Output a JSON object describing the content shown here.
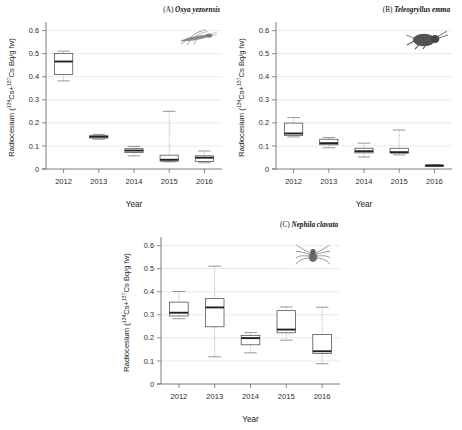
{
  "figure": {
    "axis_titles": {
      "x": "Year",
      "y_main": "Radiocesium (",
      "y_nuc1": "134",
      "y_cs1": "Cs+",
      "y_nuc2": "137",
      "y_cs2": "Cs Bq/g fw)"
    },
    "y_ticks": [
      "0",
      "0.1",
      "0.2",
      "0.3",
      "0.4",
      "0.5",
      "0.6"
    ],
    "x_ticks": [
      "2012",
      "2013",
      "2014",
      "2015",
      "2016"
    ]
  },
  "chart_data": [
    {
      "type": "box",
      "panel": "A",
      "title": "(A) Oxya yezoensis",
      "title_prefix": "(A) ",
      "species": "Oxya yezoensis",
      "icon": "grasshopper-icon",
      "xlabel": "Year",
      "ylabel": "Radiocesium (134Cs+137Cs Bq/g fw)",
      "categories": [
        "2012",
        "2013",
        "2014",
        "2015",
        "2016"
      ],
      "ylim": [
        0,
        0.62
      ],
      "grid": true,
      "boxes": [
        {
          "year": "2012",
          "whisker_low": 0.382,
          "q1": 0.41,
          "median": 0.466,
          "q3": 0.501,
          "whisker_high": 0.511
        },
        {
          "year": "2013",
          "whisker_low": 0.129,
          "q1": 0.134,
          "median": 0.14,
          "q3": 0.144,
          "whisker_high": 0.15
        },
        {
          "year": "2014",
          "whisker_low": 0.057,
          "q1": 0.072,
          "median": 0.08,
          "q3": 0.088,
          "whisker_high": 0.098
        },
        {
          "year": "2015",
          "whisker_low": 0.031,
          "q1": 0.034,
          "median": 0.04,
          "q3": 0.06,
          "whisker_high": 0.25
        },
        {
          "year": "2016",
          "whisker_low": 0.027,
          "q1": 0.033,
          "median": 0.049,
          "q3": 0.057,
          "whisker_high": 0.078
        }
      ]
    },
    {
      "type": "box",
      "panel": "B",
      "title": "(B) Teleogryllus emma",
      "title_prefix": "(B) ",
      "species": "Teleogryllus emma",
      "icon": "cricket-icon",
      "xlabel": "Year",
      "ylabel": "Radiocesium (134Cs+137Cs Bq/g fw)",
      "categories": [
        "2012",
        "2013",
        "2014",
        "2015",
        "2016"
      ],
      "ylim": [
        0,
        0.62
      ],
      "grid": true,
      "boxes": [
        {
          "year": "2012",
          "whisker_low": 0.139,
          "q1": 0.146,
          "median": 0.154,
          "q3": 0.199,
          "whisker_high": 0.223
        },
        {
          "year": "2013",
          "whisker_low": 0.092,
          "q1": 0.105,
          "median": 0.112,
          "q3": 0.129,
          "whisker_high": 0.136
        },
        {
          "year": "2014",
          "whisker_low": 0.052,
          "q1": 0.07,
          "median": 0.077,
          "q3": 0.09,
          "whisker_high": 0.112
        },
        {
          "year": "2015",
          "whisker_low": 0.061,
          "q1": 0.069,
          "median": 0.073,
          "q3": 0.09,
          "whisker_high": 0.169
        },
        {
          "year": "2016",
          "whisker_low": 0.013,
          "q1": 0.014,
          "median": 0.015,
          "q3": 0.017,
          "whisker_high": 0.018
        }
      ]
    },
    {
      "type": "box",
      "panel": "C",
      "title": "(C) Nephila clavata",
      "title_prefix": "(C) ",
      "species": "Nephila clavata",
      "icon": "spider-icon",
      "xlabel": "Year",
      "ylabel": "Radiocesium (134Cs+137Cs Bq/g fw)",
      "categories": [
        "2012",
        "2013",
        "2014",
        "2015",
        "2016"
      ],
      "ylim": [
        0,
        0.62
      ],
      "grid": true,
      "boxes": [
        {
          "year": "2012",
          "whisker_low": 0.283,
          "q1": 0.295,
          "median": 0.309,
          "q3": 0.355,
          "whisker_high": 0.401
        },
        {
          "year": "2013",
          "whisker_low": 0.118,
          "q1": 0.248,
          "median": 0.332,
          "q3": 0.37,
          "whisker_high": 0.511
        },
        {
          "year": "2014",
          "whisker_low": 0.135,
          "q1": 0.17,
          "median": 0.199,
          "q3": 0.211,
          "whisker_high": 0.223
        },
        {
          "year": "2015",
          "whisker_low": 0.19,
          "q1": 0.222,
          "median": 0.236,
          "q3": 0.318,
          "whisker_high": 0.334
        },
        {
          "year": "2016",
          "whisker_low": 0.088,
          "q1": 0.132,
          "median": 0.142,
          "q3": 0.215,
          "whisker_high": 0.333
        }
      ]
    }
  ]
}
